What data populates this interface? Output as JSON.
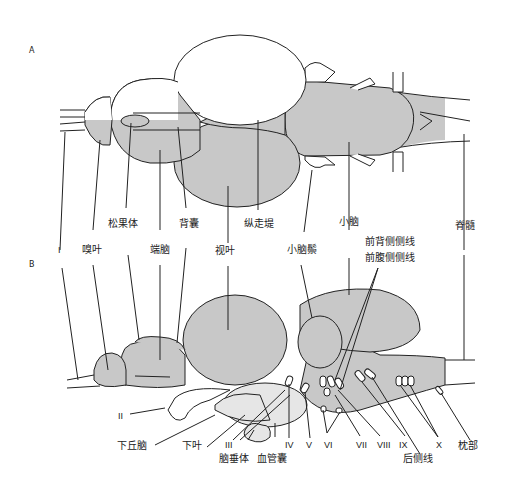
{
  "panels": {
    "a": "A",
    "b": "B"
  },
  "colors": {
    "fill_gray": "#c8c8c8",
    "fill_light": "#e6e6e6",
    "stroke": "#222222",
    "background": "#ffffff"
  },
  "labels_top": {
    "pineal": "松果体",
    "dorsal_sac": "背囊",
    "torus_longitudinalis": "纵走堤",
    "cerebellum": "小脑",
    "spinal_cord": "脊髓",
    "nerve_I": "I",
    "olfactory_bulb": "嗅叶",
    "telencephalon": "端脑",
    "optic_tectum": "视叶",
    "valvula": "小脑鬃",
    "anterodorsal_lateral_line": "前背侧侧线",
    "anteroventral_lateral_line": "前腹侧侧线"
  },
  "labels_bottom": {
    "nerve_II": "II",
    "hypothalamus": "下丘脑",
    "inferior_lobe": "下叶",
    "nerve_III": "III",
    "pituitary": "脑垂体",
    "saccus_vasculosus": "血管囊",
    "nerve_IV": "IV",
    "nerve_V": "V",
    "nerve_VI": "VI",
    "nerve_VII": "VII",
    "nerve_VIII": "VIII",
    "nerve_IX": "IX",
    "posterior_lateral_line": "后侧线",
    "nerve_X": "X",
    "occipital": "枕部"
  }
}
